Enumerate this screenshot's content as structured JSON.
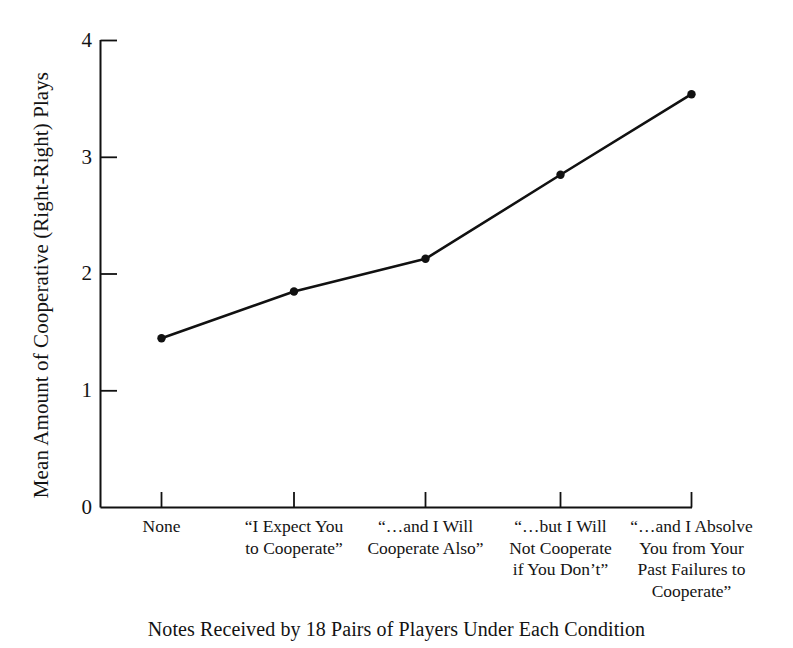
{
  "figure": {
    "caption": "Notes Received by 18 Pairs of Players Under Each Condition",
    "ylabel": "Mean Amount of Cooperative (Right-Right) Plays",
    "ink_color": "#111111",
    "background_color": "#ffffff"
  },
  "chart_data": {
    "type": "line",
    "title": "",
    "subtitle": "",
    "xlabel": "Notes Received by 18 Pairs of Players Under Each Condition",
    "ylabel": "Mean Amount of Cooperative (Right-Right) Plays",
    "categories": [
      "None",
      "“I Expect You to Cooperate”",
      "“…and I Will Cooperate Also”",
      "“…but I Will Not Cooperate if You Don’t”",
      "“…and I Absolve You from Your Past Failures to Cooperate”"
    ],
    "category_lines": [
      [
        "None"
      ],
      [
        "“I Expect You",
        "to Cooperate”"
      ],
      [
        "“…and I Will",
        "Cooperate Also”"
      ],
      [
        "“…but I Will",
        "Not Cooperate",
        "if You Don’t”"
      ],
      [
        "“…and I Absolve",
        "You from Your",
        "Past Failures to",
        "Cooperate”"
      ]
    ],
    "values": [
      1.45,
      1.85,
      2.13,
      2.85,
      3.54
    ],
    "ylim": [
      0,
      4
    ],
    "yticks": [
      0,
      1,
      2,
      3,
      4
    ],
    "ytick_labels": [
      "0",
      "1",
      "2",
      "3",
      "4"
    ],
    "grid": false,
    "legend": false,
    "marker": "filled-circle",
    "line_color": "#111111",
    "marker_color": "#111111"
  }
}
